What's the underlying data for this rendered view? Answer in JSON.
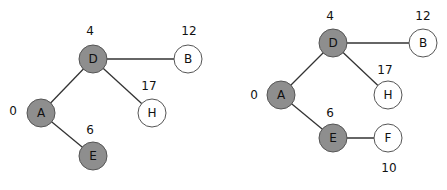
{
  "graphs": [
    {
      "nodes": [
        {
          "id": "D",
          "x": 93,
          "y": 59,
          "visited": true,
          "dist": "4",
          "dx": 90,
          "dy": 31
        },
        {
          "id": "B",
          "x": 188,
          "y": 59,
          "visited": false,
          "dist": "12",
          "dx": 189,
          "dy": 31
        },
        {
          "id": "A",
          "x": 41,
          "y": 113,
          "visited": true,
          "dist": "0",
          "dx": 13,
          "dy": 111
        },
        {
          "id": "H",
          "x": 152,
          "y": 113,
          "visited": false,
          "dist": "17",
          "dx": 149,
          "dy": 86
        },
        {
          "id": "E",
          "x": 93,
          "y": 156,
          "visited": true,
          "dist": "6",
          "dx": 90,
          "dy": 130
        }
      ],
      "edges": [
        [
          "D",
          "B"
        ],
        [
          "D",
          "A"
        ],
        [
          "D",
          "H"
        ],
        [
          "A",
          "E"
        ]
      ]
    },
    {
      "nodes": [
        {
          "id": "D",
          "x": 333,
          "y": 43,
          "visited": true,
          "dist": "4",
          "dx": 330,
          "dy": 16
        },
        {
          "id": "B",
          "x": 423,
          "y": 43,
          "visited": false,
          "dist": "12",
          "dx": 423,
          "dy": 16
        },
        {
          "id": "A",
          "x": 281,
          "y": 95,
          "visited": true,
          "dist": "0",
          "dx": 254,
          "dy": 95
        },
        {
          "id": "H",
          "x": 388,
          "y": 95,
          "visited": false,
          "dist": "17",
          "dx": 385,
          "dy": 70
        },
        {
          "id": "E",
          "x": 333,
          "y": 138,
          "visited": true,
          "dist": "6",
          "dx": 330,
          "dy": 113
        },
        {
          "id": "F",
          "x": 388,
          "y": 138,
          "visited": false,
          "dist": "10",
          "dx": 389,
          "dy": 168
        }
      ],
      "edges": [
        [
          "D",
          "B"
        ],
        [
          "D",
          "A"
        ],
        [
          "D",
          "H"
        ],
        [
          "A",
          "E"
        ],
        [
          "E",
          "F"
        ]
      ]
    }
  ],
  "colors": {
    "visited": "#8e8e8e",
    "open": "#ffffff",
    "edge": "#333333"
  }
}
